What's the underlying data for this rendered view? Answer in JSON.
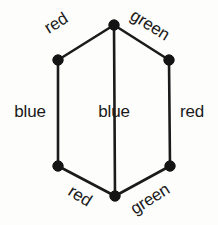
{
  "figure": {
    "name": "hexagon-edge-coloring-diagram",
    "background_color": "#fdfdfc",
    "stroke_color": "#1b1b1b",
    "vertex_color": "#141414",
    "text_color": "#1a1a1a"
  },
  "vertices": [
    {
      "id": "top",
      "x": 114,
      "y": 25,
      "label": ""
    },
    {
      "id": "upper-left",
      "x": 58,
      "y": 60,
      "label": ""
    },
    {
      "id": "upper-right",
      "x": 169,
      "y": 60,
      "label": ""
    },
    {
      "id": "lower-left",
      "x": 58,
      "y": 166,
      "label": ""
    },
    {
      "id": "lower-right",
      "x": 170,
      "y": 166,
      "label": ""
    },
    {
      "id": "bottom",
      "x": 115,
      "y": 196,
      "label": ""
    }
  ],
  "edges": [
    {
      "id": "edge-top-left",
      "from": "upper-left",
      "to": "top",
      "label": "red",
      "rotation": -32,
      "label_x": 56,
      "label_y": 23
    },
    {
      "id": "edge-top-right",
      "from": "top",
      "to": "upper-right",
      "label": "green",
      "rotation": 32,
      "label_x": 150,
      "label_y": 25
    },
    {
      "id": "edge-left-side",
      "from": "upper-left",
      "to": "lower-left",
      "label": "blue",
      "rotation": 0,
      "label_x": 30,
      "label_y": 111
    },
    {
      "id": "edge-center-chord",
      "from": "top",
      "to": "bottom",
      "label": "blue",
      "rotation": 0,
      "label_x": 114,
      "label_y": 111
    },
    {
      "id": "edge-right-side",
      "from": "upper-right",
      "to": "lower-right",
      "label": "red",
      "rotation": 0,
      "label_x": 192,
      "label_y": 111
    },
    {
      "id": "edge-bottom-left",
      "from": "lower-left",
      "to": "bottom",
      "label": "red",
      "rotation": 32,
      "label_x": 80,
      "label_y": 196
    },
    {
      "id": "edge-bottom-right",
      "from": "bottom",
      "to": "lower-right",
      "label": "green",
      "rotation": -32,
      "label_x": 150,
      "label_y": 199
    }
  ],
  "labels": {
    "red_top_left": "red",
    "green_top_right": "green",
    "blue_left": "blue",
    "blue_center": "blue",
    "red_right": "red",
    "red_bottom_left": "red",
    "green_bottom_right": "green"
  },
  "artifacts": {
    "bleed_top": "",
    "bleed_mid": "",
    "bleed_bottom": ""
  }
}
